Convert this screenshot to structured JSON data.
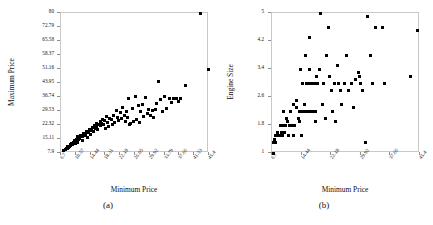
{
  "figure": {
    "panels": [
      {
        "caption": "(a)",
        "xlabel": "Minimum Price",
        "ylabel": "Maximum Price"
      },
      {
        "caption": "(b)",
        "xlabel": "Minimum Price",
        "ylabel": "Engine Size"
      }
    ]
  },
  "chart_data": [
    {
      "type": "scatter",
      "panel": "(a)",
      "title": "",
      "xlabel": "Minimum Price",
      "ylabel": "Maximum Price",
      "xlim": [
        6.7,
        45.4
      ],
      "ylim": [
        7.9,
        80
      ],
      "grid": false,
      "legend": null,
      "xticks": [
        6.7,
        10.57,
        14.44,
        18.31,
        22.18,
        26.05,
        29.92,
        33.79,
        37.66,
        41.53,
        45.4
      ],
      "xticklabels": [
        "6.7",
        "10.57",
        "14.44",
        "18.31",
        "22.18",
        "26.05",
        "29.92",
        "33.79",
        "37.66",
        "41.53",
        "45.4"
      ],
      "yticks": [
        7.9,
        15.11,
        22.32,
        29.53,
        36.74,
        43.95,
        51.16,
        58.37,
        65.58,
        72.79,
        80
      ],
      "yticklabels": [
        "7.9",
        "15.11",
        "22.32",
        "29.53",
        "36.74",
        "43.95",
        "51.16",
        "58.37",
        "65.58",
        "72.79",
        "80"
      ],
      "marker": "square",
      "marker_color": "#000000",
      "points": [
        [
          7.4,
          9.2
        ],
        [
          8.0,
          9.8
        ],
        [
          8.2,
          10.3
        ],
        [
          8.3,
          10.0
        ],
        [
          8.4,
          11.1
        ],
        [
          8.6,
          10.6
        ],
        [
          8.9,
          11.3
        ],
        [
          9.1,
          12.2
        ],
        [
          9.2,
          11.6
        ],
        [
          9.4,
          12.9
        ],
        [
          9.8,
          12.4
        ],
        [
          10.0,
          13.3
        ],
        [
          10.1,
          13.9
        ],
        [
          10.3,
          14.4
        ],
        [
          10.6,
          12.8
        ],
        [
          10.8,
          15.0
        ],
        [
          11.0,
          13.5
        ],
        [
          11.1,
          16.3
        ],
        [
          11.3,
          14.9
        ],
        [
          11.6,
          15.5
        ],
        [
          11.9,
          17.0
        ],
        [
          12.2,
          16.2
        ],
        [
          12.4,
          14.3
        ],
        [
          12.6,
          18.2
        ],
        [
          12.8,
          16.8
        ],
        [
          13.1,
          17.6
        ],
        [
          13.3,
          19.1
        ],
        [
          13.6,
          15.8
        ],
        [
          13.9,
          18.4
        ],
        [
          14.2,
          20.0
        ],
        [
          14.4,
          17.2
        ],
        [
          14.6,
          19.6
        ],
        [
          14.9,
          21.1
        ],
        [
          15.1,
          18.9
        ],
        [
          15.4,
          22.0
        ],
        [
          15.6,
          20.4
        ],
        [
          15.9,
          23.3
        ],
        [
          16.1,
          21.5
        ],
        [
          16.3,
          19.8
        ],
        [
          16.6,
          22.7
        ],
        [
          16.9,
          24.1
        ],
        [
          17.1,
          21.9
        ],
        [
          17.4,
          23.0
        ],
        [
          17.6,
          25.2
        ],
        [
          17.9,
          22.4
        ],
        [
          18.1,
          24.6
        ],
        [
          18.4,
          20.6
        ],
        [
          18.5,
          26.5
        ],
        [
          18.8,
          23.8
        ],
        [
          19.0,
          21.3
        ],
        [
          19.4,
          25.8
        ],
        [
          19.8,
          24.9
        ],
        [
          20.2,
          22.8
        ],
        [
          20.5,
          27.3
        ],
        [
          20.8,
          23.6
        ],
        [
          21.1,
          30.0
        ],
        [
          21.4,
          26.2
        ],
        [
          21.8,
          24.4
        ],
        [
          22.2,
          28.6
        ],
        [
          22.5,
          25.6
        ],
        [
          22.9,
          31.2
        ],
        [
          23.2,
          27.0
        ],
        [
          23.5,
          24.2
        ],
        [
          23.8,
          29.2
        ],
        [
          24.1,
          26.4
        ],
        [
          24.4,
          36.2
        ],
        [
          24.6,
          22.6
        ],
        [
          25.0,
          23.2
        ],
        [
          25.3,
          30.6
        ],
        [
          25.7,
          24.0
        ],
        [
          26.1,
          36.8
        ],
        [
          26.4,
          25.4
        ],
        [
          26.9,
          32.4
        ],
        [
          27.2,
          23.5
        ],
        [
          27.6,
          29.1
        ],
        [
          28.0,
          33.0
        ],
        [
          28.4,
          26.8
        ],
        [
          28.8,
          36.5
        ],
        [
          29.2,
          28.3
        ],
        [
          29.6,
          30.4
        ],
        [
          30.2,
          27.4
        ],
        [
          30.6,
          29.6
        ],
        [
          31.0,
          26.1
        ],
        [
          31.4,
          30.2
        ],
        [
          31.8,
          33.4
        ],
        [
          32.3,
          44.5
        ],
        [
          32.8,
          35.2
        ],
        [
          33.2,
          29.4
        ],
        [
          33.8,
          37.2
        ],
        [
          34.3,
          31.0
        ],
        [
          35.0,
          36.0
        ],
        [
          35.6,
          34.0
        ],
        [
          36.2,
          36.2
        ],
        [
          36.8,
          35.8
        ],
        [
          37.4,
          34.6
        ],
        [
          38.0,
          36.0
        ],
        [
          39.2,
          42.8
        ],
        [
          43.2,
          80.0
        ],
        [
          45.2,
          50.8
        ]
      ]
    },
    {
      "type": "scatter",
      "panel": "(b)",
      "title": "",
      "xlabel": "Minimum Price",
      "ylabel": "Engine Size",
      "xlim": [
        6.7,
        45.4
      ],
      "ylim": [
        1,
        5
      ],
      "grid": false,
      "legend": null,
      "xticks": [
        6.7,
        14.44,
        22.18,
        29.92,
        37.66,
        45.4
      ],
      "xticklabels": [
        "6.7",
        "14.44",
        "22.18",
        "29.92",
        "37.66",
        "45.4"
      ],
      "yticks": [
        1,
        1.8,
        2.6,
        3.4,
        4.2,
        5
      ],
      "yticklabels": [
        "1",
        "1.8",
        "2.6",
        "3.4",
        "4.2",
        "5"
      ],
      "marker": "square",
      "marker_color": "#000000",
      "points": [
        [
          7.0,
          1.0
        ],
        [
          7.2,
          1.3
        ],
        [
          7.3,
          1.4
        ],
        [
          7.5,
          1.5
        ],
        [
          7.6,
          1.3
        ],
        [
          7.8,
          1.5
        ],
        [
          8.0,
          1.5
        ],
        [
          8.2,
          1.6
        ],
        [
          8.4,
          1.5
        ],
        [
          8.6,
          1.5
        ],
        [
          8.8,
          1.5
        ],
        [
          9.0,
          1.8
        ],
        [
          9.2,
          1.6
        ],
        [
          9.4,
          1.5
        ],
        [
          9.6,
          1.8
        ],
        [
          9.8,
          2.2
        ],
        [
          10.0,
          1.6
        ],
        [
          10.3,
          1.8
        ],
        [
          10.6,
          2.0
        ],
        [
          10.8,
          1.9
        ],
        [
          11.0,
          1.5
        ],
        [
          11.3,
          1.8
        ],
        [
          11.6,
          2.2
        ],
        [
          11.9,
          1.8
        ],
        [
          12.2,
          1.5
        ],
        [
          12.4,
          2.4
        ],
        [
          12.7,
          1.8
        ],
        [
          13.0,
          2.5
        ],
        [
          13.2,
          2.3
        ],
        [
          13.5,
          2.0
        ],
        [
          13.8,
          1.9
        ],
        [
          14.0,
          2.2
        ],
        [
          14.2,
          3.4
        ],
        [
          14.4,
          1.5
        ],
        [
          14.6,
          2.2
        ],
        [
          14.8,
          3.0
        ],
        [
          15.0,
          2.2
        ],
        [
          15.2,
          2.4
        ],
        [
          15.4,
          3.8
        ],
        [
          15.6,
          3.0
        ],
        [
          15.8,
          2.2
        ],
        [
          16.0,
          3.0
        ],
        [
          16.2,
          2.2
        ],
        [
          16.4,
          4.3
        ],
        [
          16.6,
          3.4
        ],
        [
          16.8,
          3.0
        ],
        [
          17.0,
          2.2
        ],
        [
          17.2,
          3.0
        ],
        [
          17.4,
          2.2
        ],
        [
          17.6,
          3.0
        ],
        [
          17.8,
          3.0
        ],
        [
          18.0,
          2.2
        ],
        [
          18.2,
          1.9
        ],
        [
          18.4,
          3.2
        ],
        [
          18.6,
          3.0
        ],
        [
          19.0,
          3.4
        ],
        [
          19.4,
          5.0
        ],
        [
          19.8,
          2.4
        ],
        [
          20.2,
          3.0
        ],
        [
          20.6,
          2.0
        ],
        [
          21.0,
          3.8
        ],
        [
          21.4,
          4.6
        ],
        [
          21.8,
          3.2
        ],
        [
          22.2,
          2.8
        ],
        [
          22.6,
          2.2
        ],
        [
          23.0,
          3.0
        ],
        [
          23.4,
          1.9
        ],
        [
          23.8,
          3.5
        ],
        [
          24.2,
          3.0
        ],
        [
          24.6,
          2.8
        ],
        [
          25.0,
          2.4
        ],
        [
          25.6,
          3.0
        ],
        [
          26.2,
          3.8
        ],
        [
          26.8,
          2.8
        ],
        [
          27.4,
          3.0
        ],
        [
          28.0,
          2.3
        ],
        [
          28.6,
          3.1
        ],
        [
          29.2,
          3.3
        ],
        [
          29.6,
          3.2
        ],
        [
          29.9,
          3.0
        ],
        [
          30.4,
          2.8
        ],
        [
          31.2,
          1.3
        ],
        [
          31.8,
          4.9
        ],
        [
          32.4,
          3.8
        ],
        [
          33.0,
          3.0
        ],
        [
          33.8,
          4.6
        ],
        [
          35.6,
          4.6
        ],
        [
          36.2,
          3.0
        ],
        [
          43.0,
          3.2
        ],
        [
          44.8,
          4.5
        ]
      ]
    }
  ]
}
